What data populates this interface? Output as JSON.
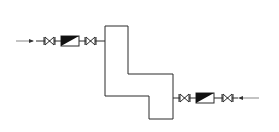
{
  "diagram": {
    "type": "process-flow-schematic",
    "colors": {
      "line": "#2a2a2a",
      "feed_line": "#9a9a9a",
      "fill_dark": "#111111",
      "background": "#ffffff"
    },
    "vessel": {
      "shape": "stepped-column",
      "points": "105,26 128,26 128,74 173,74 173,119 149,119 149,96 105,96"
    },
    "left_train": {
      "feed": {
        "x1": 16,
        "x2": 33,
        "y": 41,
        "direction": "right"
      },
      "components": [
        {
          "kind": "valve",
          "icon": "gate-valve-icon",
          "x": 44,
          "y": 41
        },
        {
          "kind": "meter",
          "icon": "flow-meter-icon",
          "x": 61,
          "y": 36,
          "w": 18,
          "h": 10
        },
        {
          "kind": "valve",
          "icon": "gate-valve-icon",
          "x": 85,
          "y": 41
        }
      ],
      "pipe": {
        "x1": 33,
        "x2": 105,
        "y": 41
      }
    },
    "right_train": {
      "feed": {
        "x1": 259,
        "x2": 236,
        "y": 98,
        "direction": "left"
      },
      "components": [
        {
          "kind": "valve",
          "icon": "gate-valve-icon",
          "x": 179,
          "y": 98
        },
        {
          "kind": "meter",
          "icon": "flow-meter-icon",
          "x": 196,
          "y": 93,
          "w": 18,
          "h": 10
        },
        {
          "kind": "valve",
          "icon": "gate-valve-icon",
          "x": 222,
          "y": 98
        }
      ],
      "pipe": {
        "x1": 173,
        "x2": 236,
        "y": 98
      }
    }
  }
}
